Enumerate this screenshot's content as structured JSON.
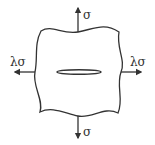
{
  "diagram": {
    "labels": {
      "top_stress": "σ",
      "bottom_stress": "σ",
      "left_stress": "λσ",
      "right_stress": "λσ"
    },
    "colors": {
      "stroke": "#333333",
      "background": "#ffffff"
    }
  }
}
